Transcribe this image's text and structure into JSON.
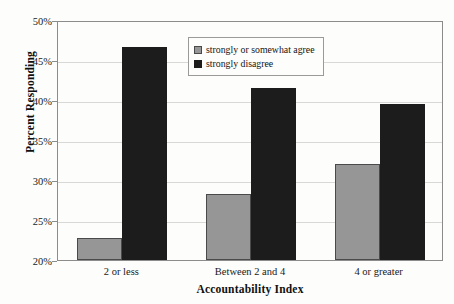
{
  "chart_data": {
    "type": "bar",
    "title": "",
    "xlabel": "Accountability Index",
    "ylabel": "Percent Responding",
    "categories": [
      "2 or less",
      "Between 2 and 4",
      "4 or greater"
    ],
    "series": [
      {
        "name": "strongly or somewhat agree",
        "color": "#969696",
        "values": [
          22.8,
          28.3,
          32.0
        ]
      },
      {
        "name": "strongly disagree",
        "color": "#1c1c1c",
        "values": [
          46.6,
          41.5,
          39.5
        ]
      }
    ],
    "ylim": [
      20,
      50
    ],
    "ytick_step": 5,
    "ytick_labels": [
      "50%",
      "45%",
      "40%",
      "35%",
      "30%",
      "25%",
      "20%"
    ],
    "ytick_values": [
      50,
      45,
      40,
      35,
      30,
      25,
      20
    ],
    "grid": true,
    "legend_position": "top-center"
  },
  "legend": {
    "entries": [
      {
        "label": "strongly or somewhat agree",
        "swatch": "agree"
      },
      {
        "label": "strongly disagree",
        "swatch": "disagree"
      }
    ]
  }
}
